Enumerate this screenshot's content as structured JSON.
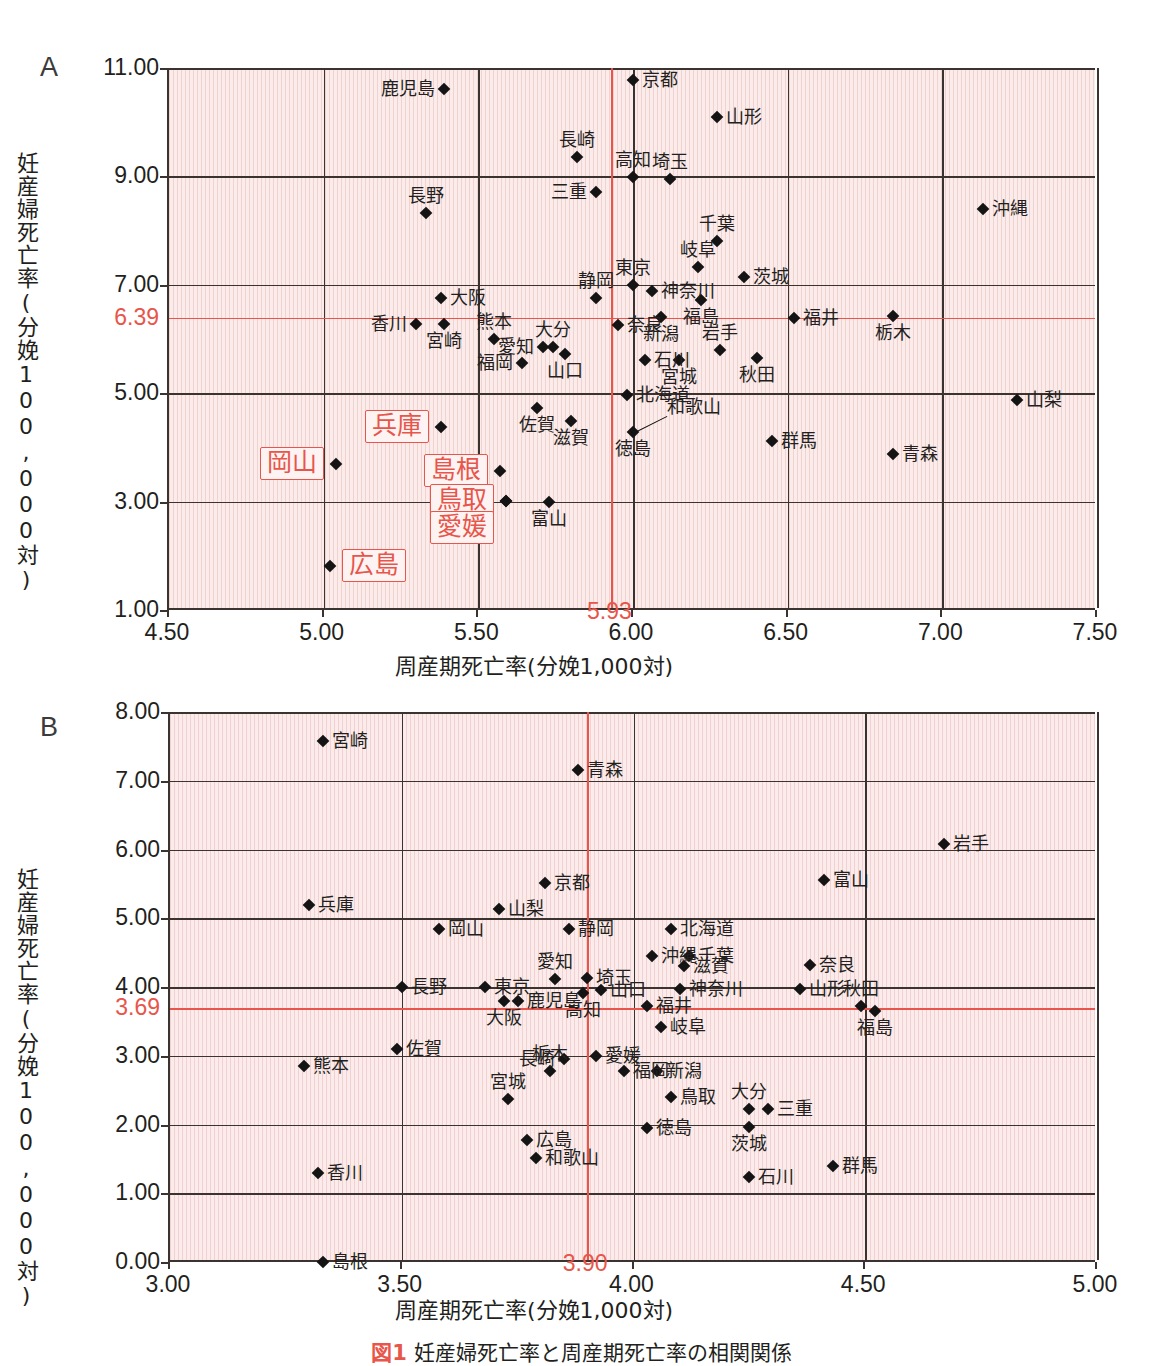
{
  "figure": {
    "caption_tag": "図1",
    "caption_text": "妊産婦死亡率と周産期死亡率の相関関係"
  },
  "chart_data": [
    {
      "panel": "A",
      "type": "scatter",
      "title": "",
      "xlabel": "周産期死亡率(分娩1,000対)",
      "ylabel": "妊産婦死亡率(分娩100,000対)",
      "xlim": [
        4.5,
        7.5
      ],
      "ylim": [
        1.0,
        11.0
      ],
      "xticks": [
        "4.50",
        "5.00",
        "5.50",
        "6.00",
        "6.50",
        "7.00",
        "7.50"
      ],
      "yticks": [
        "1.00",
        "3.00",
        "5.00",
        "7.00",
        "9.00",
        "11.00"
      ],
      "grid": true,
      "reference_lines": {
        "x_value": 5.93,
        "x_label": "5.93",
        "y_value": 6.39,
        "y_label": "6.39",
        "color": "#e8554a"
      },
      "points": [
        {
          "name": "鹿児島",
          "x": 5.39,
          "y": 10.62,
          "lpos": "left",
          "hl": false
        },
        {
          "name": "京都",
          "x": 6.0,
          "y": 10.78,
          "lpos": "right",
          "hl": false
        },
        {
          "name": "山形",
          "x": 6.27,
          "y": 10.1,
          "lpos": "right",
          "hl": false
        },
        {
          "name": "長崎",
          "x": 5.82,
          "y": 9.35,
          "lpos": "above",
          "hl": false
        },
        {
          "name": "高知",
          "x": 6.0,
          "y": 8.98,
          "lpos": "above",
          "hl": false
        },
        {
          "name": "埼玉",
          "x": 6.12,
          "y": 8.96,
          "lpos": "above",
          "hl": false
        },
        {
          "name": "三重",
          "x": 5.88,
          "y": 8.72,
          "lpos": "left",
          "hl": false
        },
        {
          "name": "長野",
          "x": 5.33,
          "y": 8.32,
          "lpos": "above",
          "hl": false
        },
        {
          "name": "沖縄",
          "x": 7.13,
          "y": 8.4,
          "lpos": "right",
          "hl": false
        },
        {
          "name": "千葉",
          "x": 6.27,
          "y": 7.8,
          "lpos": "above",
          "hl": false
        },
        {
          "name": "岐阜",
          "x": 6.21,
          "y": 7.33,
          "lpos": "above",
          "hl": false
        },
        {
          "name": "茨城",
          "x": 6.36,
          "y": 7.15,
          "lpos": "right",
          "hl": false
        },
        {
          "name": "東京",
          "x": 6.0,
          "y": 7.0,
          "lpos": "above",
          "hl": false
        },
        {
          "name": "神奈川",
          "x": 6.06,
          "y": 6.88,
          "lpos": "right",
          "hl": false
        },
        {
          "name": "大阪",
          "x": 5.38,
          "y": 6.75,
          "lpos": "right",
          "hl": false
        },
        {
          "name": "静岡",
          "x": 5.88,
          "y": 6.75,
          "lpos": "above",
          "hl": false
        },
        {
          "name": "福島",
          "x": 6.22,
          "y": 6.72,
          "lpos": "below",
          "hl": false
        },
        {
          "name": "新潟",
          "x": 6.09,
          "y": 6.4,
          "lpos": "below",
          "hl": false
        },
        {
          "name": "福井",
          "x": 6.52,
          "y": 6.39,
          "lpos": "right",
          "hl": false
        },
        {
          "name": "栃木",
          "x": 6.84,
          "y": 6.42,
          "lpos": "below",
          "hl": false
        },
        {
          "name": "香川",
          "x": 5.3,
          "y": 6.28,
          "lpos": "left",
          "hl": false
        },
        {
          "name": "宮崎",
          "x": 5.39,
          "y": 6.27,
          "lpos": "below",
          "hl": false
        },
        {
          "name": "奈良",
          "x": 5.95,
          "y": 6.26,
          "lpos": "right",
          "hl": false
        },
        {
          "name": "熊本",
          "x": 5.55,
          "y": 6.0,
          "lpos": "above",
          "hl": false
        },
        {
          "name": "大分",
          "x": 5.74,
          "y": 5.85,
          "lpos": "above",
          "hl": false
        },
        {
          "name": "愛知",
          "x": 5.71,
          "y": 5.85,
          "lpos": "left",
          "hl": false
        },
        {
          "name": "山口",
          "x": 5.78,
          "y": 5.73,
          "lpos": "below",
          "hl": false
        },
        {
          "name": "岩手",
          "x": 6.28,
          "y": 5.8,
          "lpos": "above",
          "hl": false
        },
        {
          "name": "秋田",
          "x": 6.4,
          "y": 5.65,
          "lpos": "below",
          "hl": false
        },
        {
          "name": "福岡",
          "x": 5.64,
          "y": 5.55,
          "lpos": "left",
          "hl": false
        },
        {
          "name": "宮城",
          "x": 6.15,
          "y": 5.62,
          "lpos": "below",
          "hl": false
        },
        {
          "name": "石川",
          "x": 6.04,
          "y": 5.62,
          "lpos": "right",
          "hl": false
        },
        {
          "name": "北海道",
          "x": 5.98,
          "y": 4.96,
          "lpos": "right",
          "hl": false
        },
        {
          "name": "山梨",
          "x": 7.24,
          "y": 4.87,
          "lpos": "right",
          "hl": false
        },
        {
          "name": "佐賀",
          "x": 5.69,
          "y": 4.73,
          "lpos": "below",
          "hl": false
        },
        {
          "name": "滋賀",
          "x": 5.8,
          "y": 4.49,
          "lpos": "below",
          "hl": false
        },
        {
          "name": "和歌山",
          "x": 6.0,
          "y": 4.28,
          "lpos": "leader",
          "hl": false
        },
        {
          "name": "徳島",
          "x": 6.0,
          "y": 4.28,
          "lpos": "below",
          "hl": false
        },
        {
          "name": "兵庫",
          "x": 5.38,
          "y": 4.38,
          "lpos": "boxleft",
          "hl": true
        },
        {
          "name": "島根",
          "x": 5.57,
          "y": 3.57,
          "lpos": "boxleft",
          "hl": true
        },
        {
          "name": "群馬",
          "x": 6.45,
          "y": 4.12,
          "lpos": "right",
          "hl": false
        },
        {
          "name": "青森",
          "x": 6.84,
          "y": 3.88,
          "lpos": "right",
          "hl": false
        },
        {
          "name": "岡山",
          "x": 5.04,
          "y": 3.7,
          "lpos": "boxleft",
          "hl": true
        },
        {
          "name": "鳥取",
          "x": 5.59,
          "y": 3.02,
          "lpos": "boxleft",
          "hl": true
        },
        {
          "name": "愛媛",
          "x": 5.59,
          "y": 3.02,
          "lpos": "boxbelow",
          "hl": true
        },
        {
          "name": "富山",
          "x": 5.73,
          "y": 3.0,
          "lpos": "below",
          "hl": false
        },
        {
          "name": "広島",
          "x": 5.02,
          "y": 1.82,
          "lpos": "boxright",
          "hl": true
        }
      ]
    },
    {
      "panel": "B",
      "type": "scatter",
      "title": "",
      "xlabel": "周産期死亡率(分娩1,000対)",
      "ylabel": "妊産婦死亡率(分娩100,000対)",
      "xlim": [
        3.0,
        5.0
      ],
      "ylim": [
        0.0,
        8.0
      ],
      "xticks": [
        "3.00",
        "3.50",
        "4.00",
        "4.50",
        "5.00"
      ],
      "yticks": [
        "0.00",
        "1.00",
        "2.00",
        "3.00",
        "4.00",
        "5.00",
        "6.00",
        "7.00",
        "8.00"
      ],
      "grid": true,
      "reference_lines": {
        "x_value": 3.9,
        "x_label": "3.90",
        "y_value": 3.69,
        "y_label": "3.69",
        "color": "#e8554a"
      },
      "points": [
        {
          "name": "宮崎",
          "x": 3.33,
          "y": 7.58,
          "lpos": "right",
          "hl": false
        },
        {
          "name": "青森",
          "x": 3.88,
          "y": 7.15,
          "lpos": "right",
          "hl": false
        },
        {
          "name": "岩手",
          "x": 4.67,
          "y": 6.08,
          "lpos": "right",
          "hl": false
        },
        {
          "name": "京都",
          "x": 3.81,
          "y": 5.52,
          "lpos": "right",
          "hl": false
        },
        {
          "name": "富山",
          "x": 4.41,
          "y": 5.55,
          "lpos": "right",
          "hl": false
        },
        {
          "name": "兵庫",
          "x": 3.3,
          "y": 5.2,
          "lpos": "right",
          "hl": false
        },
        {
          "name": "山梨",
          "x": 3.71,
          "y": 5.13,
          "lpos": "right",
          "hl": false
        },
        {
          "name": "岡山",
          "x": 3.58,
          "y": 4.84,
          "lpos": "right",
          "hl": false
        },
        {
          "name": "静岡",
          "x": 3.86,
          "y": 4.84,
          "lpos": "right",
          "hl": false
        },
        {
          "name": "北海道",
          "x": 4.08,
          "y": 4.84,
          "lpos": "right",
          "hl": false
        },
        {
          "name": "沖縄",
          "x": 4.04,
          "y": 4.45,
          "lpos": "right",
          "hl": false
        },
        {
          "name": "千葉",
          "x": 4.12,
          "y": 4.45,
          "lpos": "right",
          "hl": false
        },
        {
          "name": "滋賀",
          "x": 4.11,
          "y": 4.3,
          "lpos": "right",
          "hl": false
        },
        {
          "name": "奈良",
          "x": 4.38,
          "y": 4.32,
          "lpos": "right",
          "hl": false
        },
        {
          "name": "愛知",
          "x": 3.83,
          "y": 4.12,
          "lpos": "above",
          "hl": false
        },
        {
          "name": "埼玉",
          "x": 3.9,
          "y": 4.13,
          "lpos": "right",
          "hl": false
        },
        {
          "name": "長野",
          "x": 3.5,
          "y": 4.0,
          "lpos": "right",
          "hl": false
        },
        {
          "name": "東京",
          "x": 3.68,
          "y": 4.0,
          "lpos": "right",
          "hl": false
        },
        {
          "name": "山口",
          "x": 3.93,
          "y": 3.95,
          "lpos": "right",
          "hl": false
        },
        {
          "name": "神奈川",
          "x": 4.1,
          "y": 3.97,
          "lpos": "right",
          "hl": false
        },
        {
          "name": "山形",
          "x": 4.36,
          "y": 3.97,
          "lpos": "right",
          "hl": false
        },
        {
          "name": "高知",
          "x": 3.89,
          "y": 3.92,
          "lpos": "below",
          "hl": false
        },
        {
          "name": "大阪",
          "x": 3.72,
          "y": 3.8,
          "lpos": "below",
          "hl": false
        },
        {
          "name": "鹿児島",
          "x": 3.75,
          "y": 3.8,
          "lpos": "right",
          "hl": false
        },
        {
          "name": "福井",
          "x": 4.03,
          "y": 3.72,
          "lpos": "right",
          "hl": false
        },
        {
          "name": "秋田",
          "x": 4.49,
          "y": 3.72,
          "lpos": "above",
          "hl": false
        },
        {
          "name": "福島",
          "x": 4.52,
          "y": 3.65,
          "lpos": "below",
          "hl": false
        },
        {
          "name": "岐阜",
          "x": 4.06,
          "y": 3.42,
          "lpos": "right",
          "hl": false
        },
        {
          "name": "佐賀",
          "x": 3.49,
          "y": 3.1,
          "lpos": "right",
          "hl": false
        },
        {
          "name": "愛媛",
          "x": 3.92,
          "y": 3.0,
          "lpos": "right",
          "hl": false
        },
        {
          "name": "長崎",
          "x": 3.85,
          "y": 2.95,
          "lpos": "left",
          "hl": false
        },
        {
          "name": "熊本",
          "x": 3.29,
          "y": 2.85,
          "lpos": "right",
          "hl": false
        },
        {
          "name": "栃木",
          "x": 3.82,
          "y": 2.78,
          "lpos": "above",
          "hl": false
        },
        {
          "name": "福岡",
          "x": 3.98,
          "y": 2.78,
          "lpos": "right",
          "hl": false
        },
        {
          "name": "新潟",
          "x": 4.05,
          "y": 2.78,
          "lpos": "right",
          "hl": false
        },
        {
          "name": "宮城",
          "x": 3.73,
          "y": 2.37,
          "lpos": "above",
          "hl": false
        },
        {
          "name": "鳥取",
          "x": 4.08,
          "y": 2.4,
          "lpos": "right",
          "hl": false
        },
        {
          "name": "大分",
          "x": 4.25,
          "y": 2.23,
          "lpos": "above",
          "hl": false
        },
        {
          "name": "三重",
          "x": 4.29,
          "y": 2.23,
          "lpos": "right",
          "hl": false
        },
        {
          "name": "広島",
          "x": 3.77,
          "y": 1.78,
          "lpos": "right",
          "hl": false
        },
        {
          "name": "徳島",
          "x": 4.03,
          "y": 1.95,
          "lpos": "right",
          "hl": false
        },
        {
          "name": "茨城",
          "x": 4.25,
          "y": 1.97,
          "lpos": "below",
          "hl": false
        },
        {
          "name": "和歌山",
          "x": 3.79,
          "y": 1.52,
          "lpos": "right",
          "hl": false
        },
        {
          "name": "群馬",
          "x": 4.43,
          "y": 1.4,
          "lpos": "right",
          "hl": false
        },
        {
          "name": "石川",
          "x": 4.25,
          "y": 1.23,
          "lpos": "right",
          "hl": false
        },
        {
          "name": "香川",
          "x": 3.32,
          "y": 1.3,
          "lpos": "right",
          "hl": false
        },
        {
          "name": "島根",
          "x": 3.33,
          "y": 0.0,
          "lpos": "right",
          "hl": false
        }
      ]
    }
  ]
}
